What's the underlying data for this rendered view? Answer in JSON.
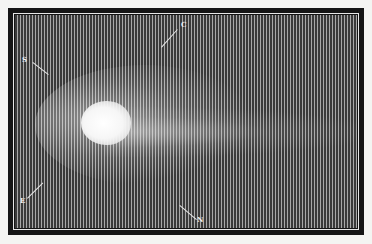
{
  "image": {
    "subject": "Engraving of a comet with bright nucleus and faint tail on vertically hatched dark sky",
    "colors": {
      "frame": "#151515",
      "sky_dark": "#3a3a3a",
      "sky_light": "#a8a8a8",
      "nucleus": "#ffffff"
    }
  },
  "labels": {
    "upper_left": "S",
    "top": "C",
    "lower_left": "E",
    "bottom": "N"
  }
}
